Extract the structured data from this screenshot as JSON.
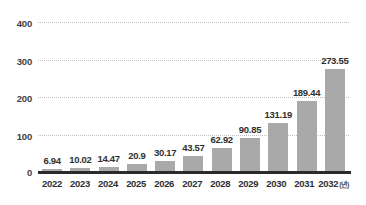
{
  "chart_data": {
    "type": "bar",
    "title": "",
    "xlabel": "",
    "ylabel": "",
    "categories": [
      "2022",
      "2023",
      "2024",
      "2025",
      "2026",
      "2027",
      "2028",
      "2029",
      "2030",
      "2031",
      "2032"
    ],
    "values": [
      6.94,
      10.02,
      14.47,
      20.9,
      30.17,
      43.57,
      62.92,
      90.85,
      131.19,
      189.44,
      273.55
    ],
    "value_labels": [
      "6.94",
      "10.02",
      "14.47",
      "20.9",
      "30.17",
      "43.57",
      "62.92",
      "90.85",
      "131.19",
      "189.44",
      "273.55"
    ],
    "ylim": [
      0,
      400
    ],
    "yticks": [
      0,
      100,
      200,
      300,
      400
    ],
    "ytick_labels": [
      "0",
      "100",
      "200",
      "300",
      "400"
    ],
    "grid": true,
    "legend": null,
    "x_axis_unit": "(년)",
    "bar_color": "#a9a9a9",
    "gridline_color": "#bfbfbf",
    "axis_color": "#2b2b2b",
    "label_color": "#2f2f2f",
    "background_color": "#ffffff"
  }
}
